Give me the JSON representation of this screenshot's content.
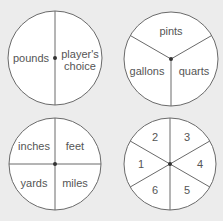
{
  "spinners": [
    {
      "name": "spinner-weight",
      "sections": 2,
      "labels": [
        "pounds",
        "player's",
        "choice"
      ],
      "segments": [
        "pounds",
        "player's choice"
      ]
    },
    {
      "name": "spinner-volume",
      "sections": 3,
      "segments": [
        "pints",
        "gallons",
        "quarts"
      ]
    },
    {
      "name": "spinner-length",
      "sections": 4,
      "segments": [
        "inches",
        "feet",
        "yards",
        "miles"
      ]
    },
    {
      "name": "spinner-numbers",
      "sections": 6,
      "segments": [
        "1",
        "2",
        "3",
        "4",
        "5",
        "6"
      ]
    }
  ],
  "colors": {
    "background": "#ececec",
    "face": "#ffffff",
    "outline": "#6a6a6a",
    "text": "#555555",
    "hub": "#333333"
  }
}
